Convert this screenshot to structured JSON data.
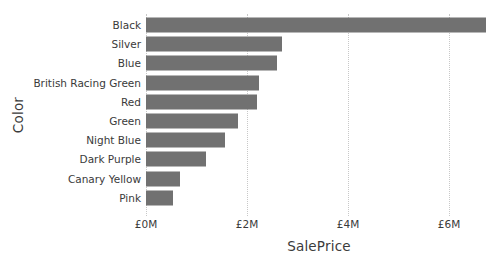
{
  "chart_data": {
    "type": "bar",
    "orientation": "horizontal",
    "title": "",
    "xlabel": "SalePrice",
    "ylabel": "Color",
    "categories": [
      "Black",
      "Silver",
      "Blue",
      "British Racing Green",
      "Red",
      "Green",
      "Night Blue",
      "Dark Purple",
      "Canary Yellow",
      "Pink"
    ],
    "values": [
      6.73,
      2.69,
      2.59,
      2.23,
      2.19,
      1.82,
      1.56,
      1.19,
      0.67,
      0.53
    ],
    "value_unit": "millions GBP",
    "xlim": [
      0,
      6.85
    ],
    "xticks": [
      0,
      2,
      4,
      6
    ],
    "xtick_labels": [
      "£0M",
      "£2M",
      "£4M",
      "£6M"
    ],
    "grid": "vertical-dotted",
    "legend": "none",
    "bar_color": "#717171",
    "gridline_color": "#c8c8c8",
    "text_color": "#3a3a3a",
    "background_color": "#ffffff"
  }
}
